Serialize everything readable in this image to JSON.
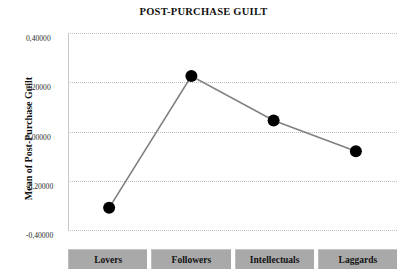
{
  "chart_data": {
    "type": "line",
    "title": "POST-PURCHASE GUILT",
    "xlabel": "",
    "ylabel": "Mean of Post-Purchase Guilt",
    "categories": [
      "Lovers",
      "Followers",
      "Intellectuals",
      "Laggards"
    ],
    "values": [
      -0.31,
      0.225,
      0.045,
      -0.08
    ],
    "ylim": [
      -0.4,
      0.4
    ],
    "ytick_labels": [
      "0,40000",
      "0,20000",
      "0,00000",
      "-0,20000",
      "-0,40000"
    ],
    "ytick_values": [
      0.4,
      0.2,
      0.0,
      -0.2,
      -0.4
    ],
    "grid": true,
    "legend": "none",
    "marker": "circle",
    "marker_color": "#000000",
    "line_color": "#808080",
    "gridline_color": "#bfbfbf",
    "category_box_color": "#a9a9a9"
  }
}
